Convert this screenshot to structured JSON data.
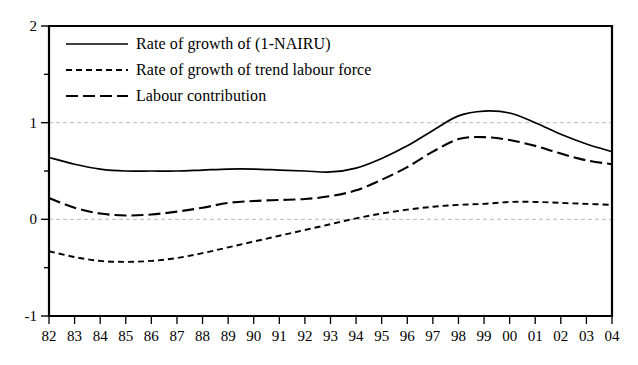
{
  "chart_data": {
    "type": "line",
    "title": "",
    "xlabel": "",
    "ylabel": "",
    "xlim": [
      1982,
      2004
    ],
    "ylim": [
      -1,
      2
    ],
    "yticks": [
      2,
      1,
      0,
      -1
    ],
    "ytick_labels": [
      "2",
      "1",
      "0",
      "-1"
    ],
    "minor_yticks": [
      1.5,
      0.5,
      -0.5
    ],
    "grid": "horizontal-dashed-at-major-yticks",
    "legend_position": "top-left-inside",
    "categories": [
      "82",
      "83",
      "84",
      "85",
      "86",
      "87",
      "88",
      "89",
      "90",
      "91",
      "92",
      "93",
      "94",
      "95",
      "96",
      "97",
      "98",
      "99",
      "00",
      "01",
      "02",
      "03",
      "04"
    ],
    "series": [
      {
        "name": "Rate of growth of (1-NAIRU)",
        "style": "solid",
        "color": "#000000",
        "values": [
          0.64,
          0.57,
          0.52,
          0.5,
          0.5,
          0.5,
          0.51,
          0.52,
          0.52,
          0.51,
          0.5,
          0.49,
          0.53,
          0.63,
          0.76,
          0.92,
          1.07,
          1.12,
          1.1,
          1.0,
          0.88,
          0.78,
          0.7
        ]
      },
      {
        "name": "Rate of growth of trend labour force",
        "style": "dotted",
        "color": "#000000",
        "values": [
          -0.33,
          -0.39,
          -0.43,
          -0.44,
          -0.43,
          -0.4,
          -0.35,
          -0.29,
          -0.23,
          -0.17,
          -0.11,
          -0.05,
          0.01,
          0.06,
          0.1,
          0.13,
          0.15,
          0.16,
          0.18,
          0.18,
          0.17,
          0.16,
          0.15
        ]
      },
      {
        "name": "Labour contribution",
        "style": "dashed",
        "color": "#000000",
        "values": [
          0.22,
          0.12,
          0.06,
          0.04,
          0.05,
          0.08,
          0.12,
          0.17,
          0.19,
          0.2,
          0.21,
          0.24,
          0.3,
          0.41,
          0.54,
          0.7,
          0.83,
          0.85,
          0.82,
          0.76,
          0.68,
          0.61,
          0.57
        ]
      }
    ]
  },
  "axes": {
    "y_axis_name": "value-axis",
    "x_axis_name": "year-axis"
  },
  "legend": {
    "entries": [
      {
        "label": "Rate of growth of (1-NAIRU)",
        "style": "solid"
      },
      {
        "label": "Rate of growth of trend labour force",
        "style": "dotted"
      },
      {
        "label": "Labour contribution",
        "style": "dashed"
      }
    ]
  }
}
